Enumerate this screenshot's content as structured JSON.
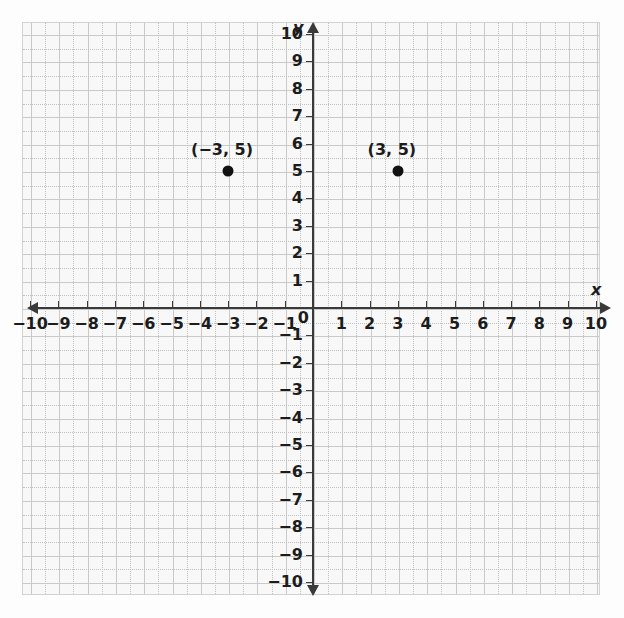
{
  "chart_data": {
    "type": "scatter",
    "title": "",
    "xlabel": "x",
    "ylabel": "y",
    "xlim": [
      -10,
      10
    ],
    "ylim": [
      -10,
      10
    ],
    "grid": true,
    "legend": null,
    "x_ticks": [
      "-10",
      "-9",
      "-8",
      "-7",
      "-6",
      "-5",
      "-4",
      "-3",
      "-2",
      "-1",
      "1",
      "2",
      "3",
      "4",
      "5",
      "6",
      "7",
      "8",
      "9",
      "10"
    ],
    "y_ticks": [
      "10",
      "9",
      "8",
      "7",
      "6",
      "5",
      "4",
      "3",
      "2",
      "1",
      "-1",
      "-2",
      "-3",
      "-4",
      "-5",
      "-6",
      "-7",
      "-8",
      "-9",
      "-10"
    ],
    "x_tick_labels": [
      "−10",
      "−9",
      "−8",
      "−7",
      "−6",
      "−5",
      "−4",
      "−3",
      "−2",
      "−1",
      "1",
      "2",
      "3",
      "4",
      "5",
      "6",
      "7",
      "8",
      "9",
      "10"
    ],
    "y_tick_labels": [
      "10",
      "9",
      "8",
      "7",
      "6",
      "5",
      "4",
      "3",
      "2",
      "1",
      "−1",
      "−2",
      "−3",
      "−4",
      "−5",
      "−6",
      "−7",
      "−8",
      "−9",
      "−10"
    ],
    "origin_label": "0",
    "points": [
      {
        "x": -3,
        "y": 5,
        "label": "(−3, 5)"
      },
      {
        "x": 3,
        "y": 5,
        "label": "(3, 5)"
      }
    ],
    "colors": {
      "point": "#111111",
      "axis": "#3a3a3a",
      "gridline": "#c9c9c9",
      "gridline_minor": "#c0c0c0",
      "background": "#f8f8f8",
      "text": "#1c1c1c"
    }
  }
}
